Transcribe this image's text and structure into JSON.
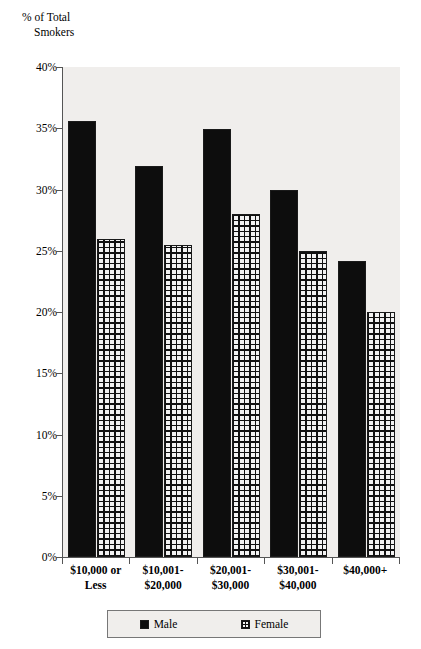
{
  "axis_title": {
    "line1": "% of Total",
    "line2": "Smokers"
  },
  "legend": {
    "items": [
      {
        "label": "Male",
        "swatch": "solid-black-swatch"
      },
      {
        "label": "Female",
        "swatch": "crosshatch-swatch"
      }
    ]
  },
  "y_ticks": [
    "40%",
    "35%",
    "30%",
    "25%",
    "20%",
    "15%",
    "10%",
    "5%",
    "0%"
  ],
  "x_labels": [
    {
      "line1": "$10,000 or",
      "line2": "Less"
    },
    {
      "line1": "$10,001-",
      "line2": "$20,000"
    },
    {
      "line1": "$20,001-",
      "line2": "$30,000"
    },
    {
      "line1": "$30,001-",
      "line2": "$40,000"
    },
    {
      "line1": "$40,000+",
      "line2": ""
    }
  ],
  "colors": {
    "male": "#0d0d0d",
    "female_fill": "#f2f2f2",
    "female_hatch": "#111111",
    "plot_background": "#f0eeec",
    "axis": "#555555"
  },
  "chart_data": {
    "type": "bar",
    "title": "",
    "subtitle": "",
    "xlabel": "",
    "ylabel": "% of Total Smokers",
    "ylim": [
      0,
      40
    ],
    "ytick_interval": 5,
    "ytick_format": "percent",
    "grid": false,
    "legend_position": "bottom",
    "categories": [
      "$10,000 or Less",
      "$10,001-$20,000",
      "$20,001-$30,000",
      "$30,001-$40,000",
      "$40,000+"
    ],
    "series": [
      {
        "name": "Male",
        "values": [
          35.6,
          31.9,
          34.9,
          30.0,
          24.2
        ]
      },
      {
        "name": "Female",
        "values": [
          26.0,
          25.5,
          28.0,
          25.0,
          20.0
        ]
      }
    ]
  }
}
